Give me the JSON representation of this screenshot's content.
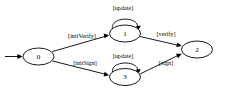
{
  "diagram": {
    "type": "state-machine",
    "background_color": "#ffffff",
    "stroke_color": "#000000",
    "states": [
      {
        "id": "0",
        "label": "0",
        "cx": 38.5,
        "cy": 56.5,
        "rx": 15.5,
        "ry": 8.5
      },
      {
        "id": "1",
        "label": "1",
        "cx": 125.0,
        "cy": 33.5,
        "rx": 15.5,
        "ry": 8.5
      },
      {
        "id": "2",
        "label": "2",
        "cx": 197.0,
        "cy": 49.5,
        "rx": 15.5,
        "ry": 8.5
      },
      {
        "id": "3",
        "label": "3",
        "cx": 125.0,
        "cy": 77.0,
        "rx": 15.5,
        "ry": 8.5
      }
    ],
    "initial_marker": {
      "name": "initial-state-arrow",
      "from_x": 5.0,
      "to_x": 22.0,
      "y": 56.5
    },
    "transitions": [
      {
        "id": "t1",
        "from": "0",
        "to": "1",
        "label": "[initVerify]",
        "label_x": 82.0,
        "label_y": 35.0
      },
      {
        "id": "t2",
        "from": "0",
        "to": "3",
        "label": "[initSign]",
        "label_x": 85.0,
        "label_y": 62.0
      },
      {
        "id": "t3",
        "from": "1",
        "to": "1",
        "label": "[update]",
        "label_x": 123.0,
        "label_y": 7.5,
        "self_loop": true
      },
      {
        "id": "t4",
        "from": "3",
        "to": "3",
        "label": "[update]",
        "label_x": 123.0,
        "label_y": 55.5,
        "self_loop": true
      },
      {
        "id": "t5",
        "from": "1",
        "to": "2",
        "label": "[verify]",
        "label_x": 166.0,
        "label_y": 33.0
      },
      {
        "id": "t6",
        "from": "3",
        "to": "2",
        "label": "[sign]",
        "label_x": 166.0,
        "label_y": 62.0
      }
    ]
  }
}
